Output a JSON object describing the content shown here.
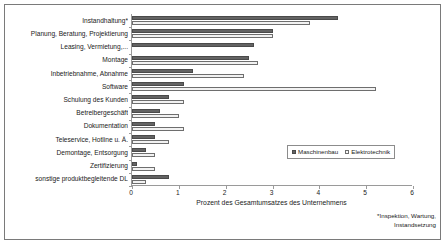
{
  "chart_data": {
    "type": "bar",
    "orientation": "horizontal",
    "title": "",
    "xlabel": "Prozent des Gesamtumsatzes des Unternehmens",
    "ylabel": "",
    "xlim": [
      0,
      6
    ],
    "xticks": [
      "0",
      "1",
      "2",
      "3",
      "4",
      "5",
      "6"
    ],
    "grid": false,
    "legend_position": "center-right",
    "categories": [
      "Instandhaltung*",
      "Planung, Beratung, Projektierung",
      "Leasing, Vermietung,...",
      "Montage",
      "Inbetriebnahme, Abnahme",
      "Software",
      "Schulung des Kunden",
      "Betreibergeschäft",
      "Dokumentation",
      "Teleservice, Hotline u. Ä.",
      "Demontage, Entsorgung",
      "Zertifizierung",
      "sonstige produktbegleitende DL"
    ],
    "series": [
      {
        "name": "Maschinenbau",
        "color": "#636363",
        "values": [
          4.4,
          3.0,
          2.6,
          2.5,
          1.3,
          1.1,
          0.8,
          0.6,
          0.5,
          0.5,
          0.3,
          0.1,
          0.8
        ]
      },
      {
        "name": "Elektrotechnik",
        "color": "#f2f2f2",
        "values": [
          3.8,
          3.0,
          0.0,
          2.7,
          2.4,
          5.2,
          1.1,
          1.0,
          1.1,
          0.8,
          0.5,
          0.5,
          0.3
        ]
      }
    ],
    "footnote": "*Inspektion, Wartung,\nInstandsetzung",
    "footnote_lines": [
      "*Inspektion, Wartung,",
      "Instandsetzung"
    ]
  }
}
